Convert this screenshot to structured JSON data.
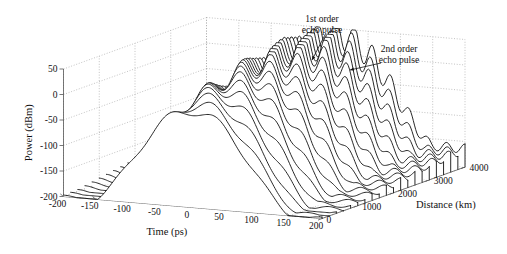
{
  "figure": {
    "kind": "3d-waterfall-plot",
    "background": "#ffffff",
    "line_color": "#111111",
    "grid_color": "#9a9a9a",
    "axis_color": "#555555"
  },
  "axes": {
    "x": {
      "label": "Time (ps)",
      "ticks": [
        "-200",
        "-150",
        "-100",
        "-50",
        "0",
        "50",
        "100",
        "150",
        "200"
      ],
      "tick_values": [
        -200,
        -150,
        -100,
        -50,
        0,
        50,
        100,
        150,
        200
      ],
      "range": [
        -200,
        200
      ]
    },
    "y": {
      "label": "Power (dBm)",
      "ticks": [
        "50",
        "0",
        "-50",
        "-100",
        "-150",
        "-200"
      ],
      "tick_values": [
        50,
        0,
        -50,
        -100,
        -150,
        -200
      ],
      "range": [
        -200,
        50
      ]
    },
    "z": {
      "label": "Distance (km)",
      "ticks": [
        "0",
        "1000",
        "2000",
        "3000",
        "4000"
      ],
      "tick_values": [
        0,
        1000,
        2000,
        3000,
        4000
      ],
      "range": [
        0,
        4000
      ]
    }
  },
  "annotations": [
    {
      "name": "first-order-echo",
      "line1": "1st order",
      "line2": "echo pulse"
    },
    {
      "name": "second-order-echo",
      "line1": "2nd order",
      "line2": "echo pulse"
    }
  ],
  "chart_data": {
    "type": "line",
    "title": "",
    "xlabel": "Time (ps)",
    "ylabel": "Power (dBm)",
    "zlabel": "Distance (km)",
    "xlim": [
      -200,
      200
    ],
    "ylim": [
      -200,
      50
    ],
    "zlim": [
      0,
      4000
    ],
    "grid": true,
    "legend": null,
    "series_axis": "Distance (km)",
    "series_z_values": [
      0,
      200,
      400,
      600,
      800,
      1000,
      1200,
      1400,
      1600,
      1800,
      2000,
      2200,
      2400,
      2600,
      2800,
      3000,
      3200,
      3400,
      3600,
      3800,
      4000
    ],
    "x_samples": [
      -200,
      -190,
      -180,
      -170,
      -160,
      -150,
      -140,
      -130,
      -120,
      -110,
      -100,
      -90,
      -80,
      -70,
      -60,
      -50,
      -40,
      -30,
      -20,
      -10,
      0,
      10,
      20,
      30,
      40,
      50,
      60,
      70,
      80,
      90,
      100,
      110,
      120,
      130,
      140,
      150,
      160,
      170,
      180,
      190,
      200
    ],
    "series": [
      {
        "name": "0 km",
        "z": 0,
        "peak_dbm": -10,
        "baseline_dbm": -200,
        "ripple_dbm": 8
      },
      {
        "name": "200 km",
        "z": 200,
        "peak_dbm": -4,
        "baseline_dbm": -200,
        "ripple_dbm": 9
      },
      {
        "name": "400 km",
        "z": 400,
        "peak_dbm": 2,
        "baseline_dbm": -200,
        "ripple_dbm": 10
      },
      {
        "name": "600 km",
        "z": 600,
        "peak_dbm": 7,
        "baseline_dbm": -198,
        "ripple_dbm": 11
      },
      {
        "name": "800 km",
        "z": 800,
        "peak_dbm": 12,
        "baseline_dbm": -196,
        "ripple_dbm": 12
      },
      {
        "name": "1000 km",
        "z": 1000,
        "peak_dbm": 16,
        "baseline_dbm": -194,
        "ripple_dbm": 13
      },
      {
        "name": "1200 km",
        "z": 1200,
        "peak_dbm": 20,
        "baseline_dbm": -192,
        "ripple_dbm": 14
      },
      {
        "name": "1400 km",
        "z": 1400,
        "peak_dbm": 23,
        "baseline_dbm": -190,
        "ripple_dbm": 15
      },
      {
        "name": "1600 km",
        "z": 1600,
        "peak_dbm": 26,
        "baseline_dbm": -188,
        "ripple_dbm": 16
      },
      {
        "name": "1800 km",
        "z": 1800,
        "peak_dbm": 29,
        "baseline_dbm": -186,
        "ripple_dbm": 17
      },
      {
        "name": "2000 km",
        "z": 2000,
        "peak_dbm": 31,
        "baseline_dbm": -184,
        "ripple_dbm": 18
      },
      {
        "name": "2200 km",
        "z": 2200,
        "peak_dbm": 33,
        "baseline_dbm": -182,
        "ripple_dbm": 19
      },
      {
        "name": "2400 km",
        "z": 2400,
        "peak_dbm": 35,
        "baseline_dbm": -180,
        "ripple_dbm": 20
      },
      {
        "name": "2600 km",
        "z": 2600,
        "peak_dbm": 36,
        "baseline_dbm": -178,
        "ripple_dbm": 21
      },
      {
        "name": "2800 km",
        "z": 2800,
        "peak_dbm": 38,
        "baseline_dbm": -176,
        "ripple_dbm": 22
      },
      {
        "name": "3000 km",
        "z": 3000,
        "peak_dbm": 39,
        "baseline_dbm": -174,
        "ripple_dbm": 23
      },
      {
        "name": "3200 km",
        "z": 3200,
        "peak_dbm": 40,
        "baseline_dbm": -172,
        "ripple_dbm": 24
      },
      {
        "name": "3400 km",
        "z": 3400,
        "peak_dbm": 40,
        "baseline_dbm": -170,
        "ripple_dbm": 24
      },
      {
        "name": "3600 km",
        "z": 3600,
        "peak_dbm": 41,
        "baseline_dbm": -168,
        "ripple_dbm": 25
      },
      {
        "name": "3800 km",
        "z": 3800,
        "peak_dbm": 41,
        "baseline_dbm": -166,
        "ripple_dbm": 25
      },
      {
        "name": "4000 km",
        "z": 4000,
        "peak_dbm": 42,
        "baseline_dbm": -164,
        "ripple_dbm": 26
      }
    ]
  }
}
